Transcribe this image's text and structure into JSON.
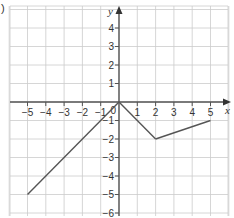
{
  "part_label": ")",
  "chart_data": {
    "type": "line",
    "title": "",
    "xlabel": "x",
    "ylabel": "y",
    "xlim": [
      -6,
      6
    ],
    "ylim": [
      -6,
      5
    ],
    "grid": true,
    "xticks": [
      -5,
      -4,
      -3,
      -2,
      -1,
      1,
      2,
      3,
      4,
      5
    ],
    "yticks": [
      -6,
      -5,
      -4,
      -3,
      -2,
      -1,
      1,
      2,
      3,
      4
    ],
    "origin_label": "0",
    "series": [
      {
        "name": "graph",
        "points": [
          [
            -5,
            -5
          ],
          [
            0,
            0
          ],
          [
            2,
            -2
          ],
          [
            5,
            -1
          ]
        ]
      }
    ]
  }
}
